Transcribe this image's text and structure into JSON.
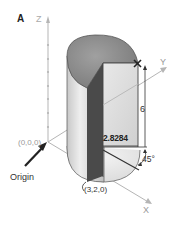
{
  "figure": {
    "panel_label": "A",
    "axes": {
      "z_label": "Z",
      "y_label": "Y",
      "x_label": "X"
    },
    "origin": {
      "coordinate": "(0,0,0)",
      "label": "Origin"
    },
    "point": "(3,2,0)",
    "dimensions": {
      "height": "6",
      "width": "2.8284",
      "angle": "45°"
    },
    "colors": {
      "axis": "#b5b5b5",
      "cylinder_top": "#8a8a8a",
      "cylinder_side": "#d8d8d8",
      "plane_face": "#e4e4e4",
      "plane_shadow": "#555555",
      "dimension_lines": "#333333"
    }
  }
}
